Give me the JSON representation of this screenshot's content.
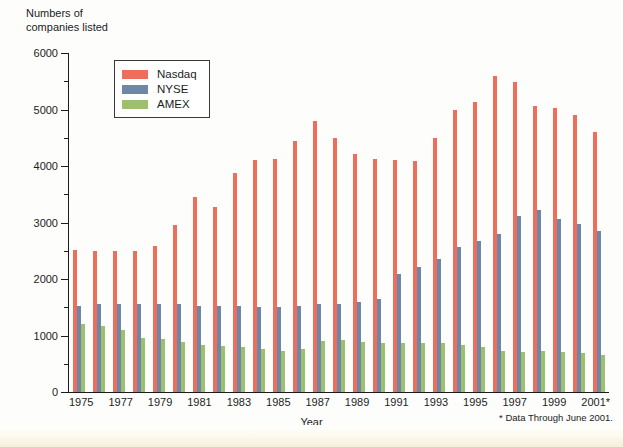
{
  "figure": {
    "y_axis_title": "Numbers of\ncompanies listed",
    "x_axis_title": "Year",
    "footnote": "* Data Through June 2001."
  },
  "legend": {
    "position": "top-left-inside",
    "entries": [
      {
        "label": "Nasdaq",
        "color": "#ee6d5b",
        "swatch": "nasdaq-swatch"
      },
      {
        "label": "NYSE",
        "color": "#6e87a8",
        "swatch": "nyse-swatch"
      },
      {
        "label": "AMEX",
        "color": "#9cc06d",
        "swatch": "amex-swatch"
      }
    ]
  },
  "y_ticks": [
    "0",
    "1000",
    "2000",
    "3000",
    "4000",
    "5000",
    "6000"
  ],
  "x_tick_labels": [
    "1975",
    "",
    "1977",
    "",
    "1979",
    "",
    "1981",
    "",
    "1983",
    "",
    "1985",
    "",
    "1987",
    "",
    "1989",
    "",
    "1991",
    "",
    "1993",
    "",
    "1995",
    "",
    "1997",
    "",
    "1999",
    "",
    "2001*"
  ],
  "chart_data": {
    "type": "bar",
    "title": "",
    "subtitle": "",
    "xlabel": "Year",
    "ylabel": "Numbers of companies listed",
    "ylim": [
      0,
      6000
    ],
    "ytick_step": 1000,
    "yminor_step": 500,
    "grid": false,
    "legend_position": "upper left",
    "annotations": [
      "* Data Through June 2001."
    ],
    "categories": [
      "1975",
      "1976",
      "1977",
      "1978",
      "1979",
      "1980",
      "1981",
      "1982",
      "1983",
      "1984",
      "1985",
      "1986",
      "1987",
      "1988",
      "1989",
      "1990",
      "1991",
      "1992",
      "1993",
      "1994",
      "1995",
      "1996",
      "1997",
      "1998",
      "1999",
      "2000",
      "2001*"
    ],
    "series": [
      {
        "name": "Nasdaq",
        "color": "#ee6d5b",
        "values": [
          2520,
          2500,
          2490,
          2500,
          2580,
          2950,
          3450,
          3280,
          3880,
          4100,
          4120,
          4450,
          4800,
          4500,
          4220,
          4120,
          4100,
          4080,
          4500,
          5000,
          5130,
          5600,
          5490,
          5070,
          5020,
          4900,
          4600
        ]
      },
      {
        "name": "NYSE",
        "color": "#6e87a8",
        "values": [
          1520,
          1550,
          1560,
          1560,
          1560,
          1550,
          1520,
          1520,
          1520,
          1510,
          1500,
          1520,
          1550,
          1560,
          1600,
          1640,
          2080,
          2220,
          2360,
          2560,
          2680,
          2800,
          3110,
          3230,
          3060,
          2980,
          2850
        ]
      },
      {
        "name": "AMEX",
        "color": "#9cc06d",
        "values": [
          1200,
          1160,
          1100,
          960,
          930,
          890,
          830,
          820,
          800,
          760,
          720,
          760,
          900,
          920,
          880,
          870,
          870,
          860,
          870,
          840,
          790,
          720,
          700,
          720,
          700,
          690,
          650
        ]
      }
    ]
  }
}
